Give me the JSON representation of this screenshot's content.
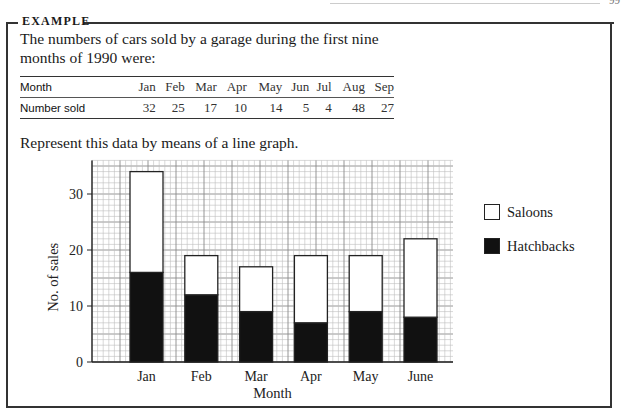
{
  "page": {
    "page_number": "99"
  },
  "example": {
    "label": "EXAMPLE",
    "intro": "The numbers of cars sold by a garage during the first nine months of 1990 were:",
    "table": {
      "row_labels": [
        "Month",
        "Number sold"
      ],
      "months": [
        "Jan",
        "Feb",
        "Mar",
        "Apr",
        "May",
        "Jun",
        "Jul",
        "Aug",
        "Sep"
      ],
      "values": [
        "32",
        "25",
        "17",
        "10",
        "14",
        "5",
        "4",
        "48",
        "27"
      ]
    },
    "prompt": "Represent this data by means of a line graph."
  },
  "chart_data": {
    "type": "bar",
    "stacked": true,
    "title": "",
    "xlabel": "Month",
    "ylabel": "No. of sales",
    "categories": [
      "Jan",
      "Feb",
      "Mar",
      "Apr",
      "May",
      "June"
    ],
    "series": [
      {
        "name": "Hatchbacks",
        "color": "#111111",
        "values": [
          16,
          12,
          9,
          7,
          9,
          8
        ]
      },
      {
        "name": "Saloons",
        "color": "#ffffff",
        "values": [
          18,
          7,
          8,
          12,
          10,
          14
        ]
      }
    ],
    "totals": [
      34,
      19,
      17,
      19,
      19,
      22
    ],
    "yticks": [
      0,
      10,
      20,
      30
    ],
    "ylim": [
      0,
      36
    ],
    "grid": true,
    "grid_style": "graph paper, minor every 1 unit, major every 5 units",
    "legend": {
      "position": "right",
      "entries": [
        "Saloons",
        "Hatchbacks"
      ]
    }
  },
  "legend": {
    "saloons": "Saloons",
    "hatchbacks": "Hatchbacks"
  }
}
